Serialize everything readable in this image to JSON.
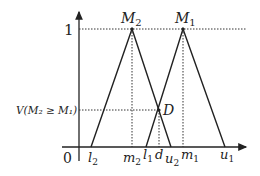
{
  "diagram": {
    "y_tick_one": "1",
    "origin": "0",
    "v_label": "V(M₂ ≥ M₁)",
    "peaks": {
      "M2": {
        "label": "M",
        "sub": "2"
      },
      "M1": {
        "label": "M",
        "sub": "1"
      }
    },
    "intersection_label": "D",
    "x_labels": [
      {
        "id": "l2",
        "base": "l",
        "sub": "2"
      },
      {
        "id": "m2",
        "base": "m",
        "sub": "2"
      },
      {
        "id": "l1",
        "base": "l",
        "sub": "1"
      },
      {
        "id": "d",
        "base": "d",
        "sub": ""
      },
      {
        "id": "u2",
        "base": "u",
        "sub": "2"
      },
      {
        "id": "m1",
        "base": "m",
        "sub": "1"
      },
      {
        "id": "u1",
        "base": "u",
        "sub": "1"
      }
    ],
    "colors": {
      "line": "#222222",
      "dotted": "#333333"
    }
  }
}
